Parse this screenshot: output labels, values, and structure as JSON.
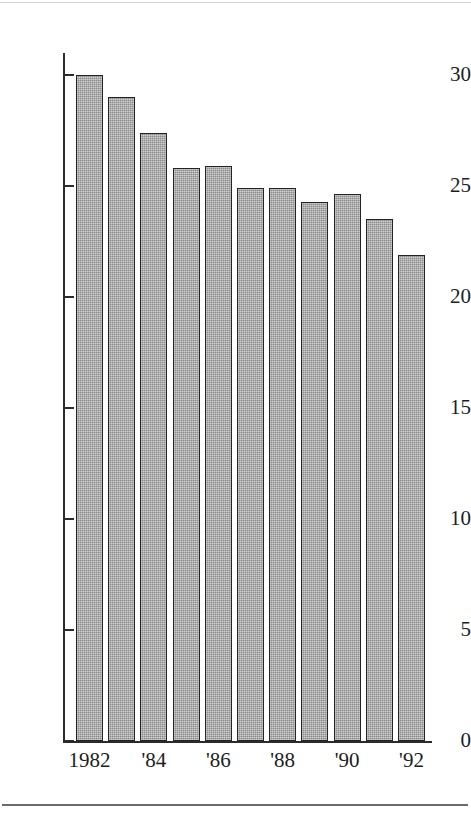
{
  "figure": {
    "title": "",
    "top_rule_color": "#d2d2d4",
    "bottom_rule_color": "#6a6a70",
    "axis_color": "#2b2b2b",
    "bar_fill_color": "#9c9c9c",
    "bar_border_color": "#232323",
    "background_color": "#ffffff"
  },
  "chart_data": {
    "type": "bar",
    "title": "",
    "subtitle": "",
    "xlabel": "",
    "ylabel": "",
    "grid": false,
    "legend": null,
    "ylim": [
      0,
      31.5
    ],
    "yticks": [
      0,
      5,
      10,
      15,
      20,
      25,
      30
    ],
    "ytick_labels": [
      "0",
      "5",
      "10",
      "15",
      "20",
      "25",
      "30"
    ],
    "categories": [
      "1982",
      "1983",
      "1984",
      "1985",
      "1986",
      "1987",
      "1988",
      "1989",
      "1990",
      "1991",
      "1992"
    ],
    "xtick_labels": [
      "1982",
      "",
      "'84",
      "",
      "'86",
      "",
      "'88",
      "",
      "'90",
      "",
      "'92"
    ],
    "values": [
      30.0,
      29.0,
      27.4,
      25.8,
      25.9,
      24.9,
      24.9,
      24.3,
      24.65,
      23.5,
      21.9
    ]
  }
}
